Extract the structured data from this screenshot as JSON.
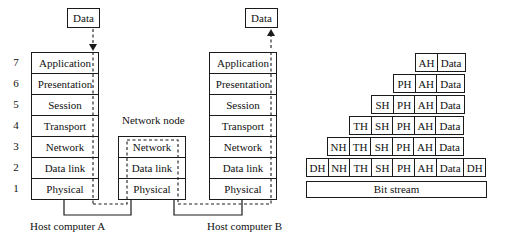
{
  "left_diagram": {
    "host_a": {
      "label": "Host computer A",
      "data_box": "Data",
      "layers": [
        {
          "num": "7",
          "name": "Application"
        },
        {
          "num": "6",
          "name": "Presentation"
        },
        {
          "num": "5",
          "name": "Session"
        },
        {
          "num": "4",
          "name": "Transport"
        },
        {
          "num": "3",
          "name": "Network"
        },
        {
          "num": "2",
          "name": "Data link"
        },
        {
          "num": "1",
          "name": "Physical"
        }
      ]
    },
    "network_node": {
      "label": "Network node",
      "layers": [
        {
          "name": "Network"
        },
        {
          "name": "Data link"
        },
        {
          "name": "Physical"
        }
      ]
    },
    "host_b": {
      "label": "Host computer B",
      "data_box": "Data",
      "layers": [
        {
          "name": "Application"
        },
        {
          "name": "Presentation"
        },
        {
          "name": "Session"
        },
        {
          "name": "Transport"
        },
        {
          "name": "Network"
        },
        {
          "name": "Data link"
        },
        {
          "name": "Physical"
        }
      ]
    }
  },
  "right_diagram": {
    "rows": [
      {
        "cells": [
          "AH",
          "Data"
        ]
      },
      {
        "cells": [
          "PH",
          "AH",
          "Data"
        ]
      },
      {
        "cells": [
          "SH",
          "PH",
          "AH",
          "Data"
        ]
      },
      {
        "cells": [
          "TH",
          "SH",
          "PH",
          "AH",
          "Data"
        ]
      },
      {
        "cells": [
          "NH",
          "TH",
          "SH",
          "PH",
          "AH",
          "Data"
        ]
      },
      {
        "cells": [
          "DH",
          "NH",
          "TH",
          "SH",
          "PH",
          "AH",
          "Data",
          "DH"
        ]
      }
    ],
    "bit_stream": "Bit stream"
  }
}
